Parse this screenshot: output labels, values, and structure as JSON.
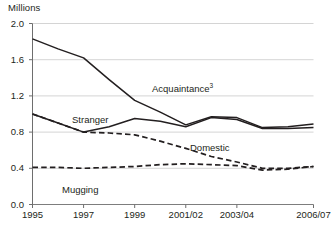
{
  "chart_data": {
    "type": "line",
    "title": "",
    "subtitle": "",
    "xlabel": "",
    "ylabel": "Millions",
    "ylim": [
      0.0,
      2.0
    ],
    "yticks": [
      "0.0",
      "0.4",
      "0.8",
      "1.2",
      "1.6",
      "2.0"
    ],
    "ytick_values": [
      0.0,
      0.4,
      0.8,
      1.2,
      1.6,
      2.0
    ],
    "grid": true,
    "legend_position": "inline-annotations",
    "x": [
      "1995",
      "1996",
      "1997",
      "1998",
      "1999",
      "2000",
      "2001/02",
      "2002/03",
      "2003/04",
      "2004/05",
      "2005/06",
      "2006/07"
    ],
    "xticks_shown": [
      "1995",
      "1997",
      "1999",
      "2001/02",
      "2003/04",
      "2006/07"
    ],
    "xtick_indices": [
      0,
      2,
      4,
      6,
      8,
      11
    ],
    "series": [
      {
        "name": "Acquaintance",
        "label": "Acquaintance",
        "footnote": "3",
        "style": "solid",
        "color": "#231f20",
        "values": [
          1.83,
          1.72,
          1.62,
          1.38,
          1.15,
          1.02,
          0.88,
          0.97,
          0.96,
          0.85,
          0.86,
          0.89
        ]
      },
      {
        "name": "Stranger",
        "label": "Stranger",
        "footnote": "",
        "style": "solid",
        "color": "#231f20",
        "values": [
          1.0,
          0.9,
          0.8,
          0.86,
          0.95,
          0.92,
          0.86,
          0.96,
          0.94,
          0.84,
          0.84,
          0.85
        ]
      },
      {
        "name": "Domestic",
        "label": "Domestic",
        "footnote": "",
        "style": "dashed",
        "color": "#231f20",
        "values": [
          1.0,
          0.9,
          0.8,
          0.79,
          0.77,
          0.7,
          0.62,
          0.53,
          0.47,
          0.4,
          0.4,
          0.42
        ]
      },
      {
        "name": "Mugging",
        "label": "Mugging",
        "footnote": "",
        "style": "dashed",
        "color": "#231f20",
        "values": [
          0.41,
          0.41,
          0.4,
          0.41,
          0.42,
          0.44,
          0.45,
          0.44,
          0.43,
          0.38,
          0.39,
          0.42
        ]
      }
    ],
    "annotations": [
      {
        "text": "Acquaintance",
        "sup": "3",
        "x_px": 152,
        "y_px": 82
      },
      {
        "text": "Stranger",
        "sup": "",
        "x_px": 72,
        "y_px": 114
      },
      {
        "text": "Domestic",
        "sup": "",
        "x_px": 190,
        "y_px": 142
      },
      {
        "text": "Mugging",
        "sup": "",
        "x_px": 62,
        "y_px": 184
      }
    ]
  },
  "axis": {
    "unit_label": "Millions"
  },
  "colors": {
    "line": "#231f20",
    "grid": "#c9c9c9",
    "axis": "#6e6e6e",
    "text": "#231f20",
    "background": "#ffffff"
  }
}
